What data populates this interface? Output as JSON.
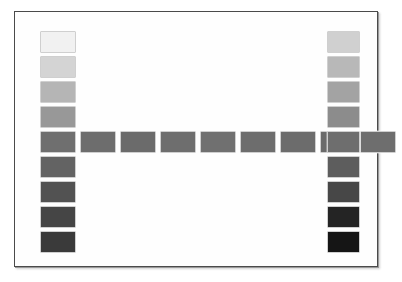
{
  "chart": {
    "type": "grayscale-step-wedge",
    "background_color": "#ffffff",
    "frame": {
      "border_color": "#4a4a4a",
      "fill_color": "#fefefe",
      "x": 14,
      "y": 11,
      "width": 364,
      "height": 256
    },
    "patch_border_color": "#cfcfcf"
  },
  "chart_data": {
    "type": "heatmap",
    "subtitle": "",
    "xlabel": "",
    "ylabel": "",
    "grid": false,
    "legend_position": "none",
    "groups": [
      {
        "name": "left-column",
        "orientation": "vertical",
        "count": 9,
        "patch_width": 36,
        "patch_height": 22,
        "x": 40,
        "y_start": 31,
        "y_step": 25,
        "values": [
          97,
          85,
          72,
          60,
          48,
          41,
          33,
          27,
          22
        ],
        "colors": [
          "#f1f1f1",
          "#d4d4d4",
          "#b5b5b5",
          "#989898",
          "#6f6f6f",
          "#636363",
          "#525252",
          "#454545",
          "#3a3a3a"
        ]
      },
      {
        "name": "middle-row",
        "orientation": "horizontal",
        "count": 8,
        "patch_width": 36,
        "patch_height": 22,
        "y": 131,
        "x_start": 80,
        "x_step": 40,
        "values": [
          47,
          46,
          45,
          45,
          45,
          45,
          44,
          44
        ],
        "colors": [
          "#6d6d6d",
          "#6b6b6b",
          "#6e6e6e",
          "#707070",
          "#6d6d6d",
          "#6c6c6c",
          "#6b6b6b",
          "#6e6e6e"
        ]
      },
      {
        "name": "right-column",
        "orientation": "vertical",
        "count": 9,
        "patch_width": 33,
        "patch_height": 22,
        "x": 327,
        "y_start": 31,
        "y_step": 25,
        "values": [
          82,
          72,
          62,
          53,
          45,
          36,
          28,
          14,
          8
        ],
        "colors": [
          "#d0d0d0",
          "#b8b8b8",
          "#a3a3a3",
          "#8c8c8c",
          "#6e6e6e",
          "#5d5d5d",
          "#474747",
          "#242424",
          "#151515"
        ]
      }
    ]
  }
}
